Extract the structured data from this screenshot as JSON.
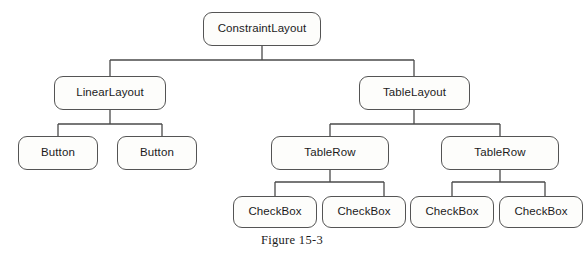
{
  "figure": {
    "caption": "Figure 15-3",
    "background_color": "#ffffff",
    "node_border_color": "#545454",
    "node_fill_color": "#fdfdfb",
    "connector_color": "#4a4a4a",
    "text_color": "#1b1b1b"
  },
  "tree": {
    "root": {
      "label": "ConstraintLayout"
    },
    "level2": [
      {
        "label": "LinearLayout"
      },
      {
        "label": "TableLayout"
      }
    ],
    "level3": [
      {
        "label": "Button"
      },
      {
        "label": "Button"
      },
      {
        "label": "TableRow"
      },
      {
        "label": "TableRow"
      }
    ],
    "level4": [
      {
        "label": "CheckBox"
      },
      {
        "label": "CheckBox"
      },
      {
        "label": "CheckBox"
      },
      {
        "label": "CheckBox"
      }
    ]
  }
}
